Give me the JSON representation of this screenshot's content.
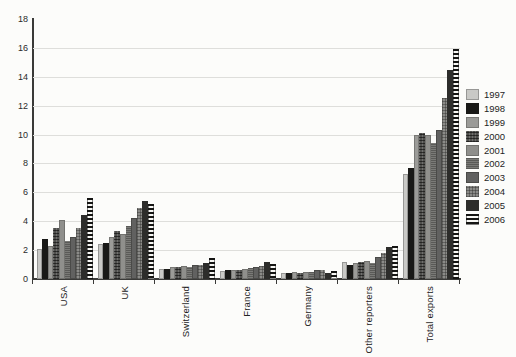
{
  "chart_data": {
    "type": "bar",
    "title": "",
    "xlabel": "",
    "ylabel": "",
    "categories": [
      "USA",
      "UK",
      "Switzerland",
      "France",
      "Germany",
      "Other reporters",
      "Total exports"
    ],
    "series": [
      {
        "name": "1997",
        "values": [
          2.1,
          2.4,
          0.7,
          0.55,
          0.45,
          1.2,
          7.3
        ]
      },
      {
        "name": "1998",
        "values": [
          2.8,
          2.5,
          0.7,
          0.6,
          0.45,
          1.0,
          7.7
        ]
      },
      {
        "name": "1999",
        "values": [
          2.3,
          2.9,
          0.8,
          0.6,
          0.5,
          1.1,
          10.0
        ]
      },
      {
        "name": "2000",
        "values": [
          3.5,
          3.3,
          0.8,
          0.65,
          0.45,
          1.2,
          10.1
        ]
      },
      {
        "name": "2001",
        "values": [
          4.1,
          3.1,
          0.9,
          0.7,
          0.5,
          1.25,
          10.0
        ]
      },
      {
        "name": "2002",
        "values": [
          2.6,
          3.7,
          0.8,
          0.75,
          0.5,
          1.1,
          9.4
        ]
      },
      {
        "name": "2003",
        "values": [
          2.9,
          4.2,
          1.0,
          0.85,
          0.65,
          1.55,
          10.3
        ]
      },
      {
        "name": "2004",
        "values": [
          3.5,
          4.9,
          1.0,
          0.9,
          0.6,
          1.8,
          12.5
        ]
      },
      {
        "name": "2005",
        "values": [
          4.4,
          5.4,
          1.1,
          1.15,
          0.45,
          2.2,
          14.5
        ]
      },
      {
        "name": "2006",
        "values": [
          5.6,
          5.2,
          1.45,
          1.05,
          0.55,
          2.3,
          15.9
        ]
      }
    ],
    "ylim": [
      0,
      18
    ],
    "yticks": [
      0,
      2,
      4,
      6,
      8,
      10,
      12,
      14,
      16,
      18
    ],
    "grid": "horizontal",
    "legend_position": "right",
    "legend_entries": [
      "1997",
      "1998",
      "1999",
      "2000",
      "2001",
      "2002",
      "2003",
      "2004",
      "2005",
      "2006"
    ],
    "colors": {
      "axis": "#3a3a38",
      "gridline": "#dededb",
      "background": "#fcfcfa",
      "series_fills": [
        "#c9c9c6",
        "#191917",
        "#9b9b98",
        "#4f4f4d",
        "#8f8f8c",
        "#7a7a77",
        "#616160",
        "#8b8b88",
        "#2d2d2b",
        "striped-black-white"
      ]
    }
  }
}
